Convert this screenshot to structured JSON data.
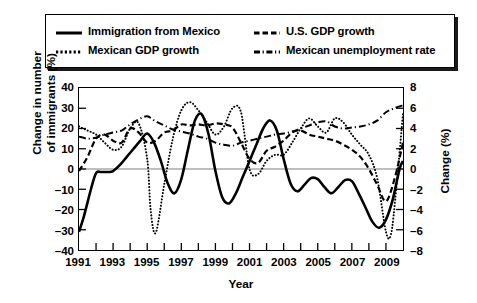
{
  "chart_data": {
    "type": "line",
    "title": "",
    "xlabel": "Year",
    "ylabel": "Change in number of immigrants (%)",
    "ylabel_line1": "Change in number",
    "ylabel_line2": "of immigrants (%)",
    "ylabel_right": "Change (%)",
    "xlim": [
      1991,
      2010
    ],
    "ylim": [
      -40,
      40
    ],
    "ylim_right": [
      -8,
      8
    ],
    "grid": false,
    "zero_line": true,
    "legend_position": "above-plot",
    "x_ticks": [
      1991,
      1993,
      1995,
      1997,
      1999,
      2001,
      2003,
      2005,
      2007,
      2009
    ],
    "x_tick_labels": [
      "1991",
      "1993",
      "1995",
      "1997",
      "1999",
      "2001",
      "2003",
      "2005",
      "2007",
      "2009"
    ],
    "x_minor_ticks": [
      1992,
      1994,
      1996,
      1998,
      2000,
      2002,
      2004,
      2006,
      2008,
      2010
    ],
    "y_ticks_left": [
      40,
      30,
      20,
      10,
      0,
      -10,
      -20,
      -30,
      -40
    ],
    "y_tick_labels_left": [
      "40",
      "30",
      "20",
      "10",
      "0",
      "–10",
      "–20",
      "–30",
      "–40"
    ],
    "y_ticks_right": [
      8,
      6,
      4,
      2,
      0,
      -2,
      -4,
      -6,
      -8
    ],
    "y_tick_labels_right": [
      "8",
      "6",
      "4",
      "2",
      "0",
      "–2",
      "–4",
      "–6",
      "–8"
    ],
    "colors": {
      "line": "#000000",
      "zero_line": "#808080",
      "frame": "#000000",
      "background": "#ffffff"
    },
    "series": [
      {
        "name": "Immigration from Mexico",
        "axis": "left",
        "style": "solid",
        "line_width": 2.6,
        "x": [
          1991.0,
          1991.3,
          1991.7,
          1992.0,
          1992.3,
          1992.7,
          1993.0,
          1993.4,
          1993.8,
          1994.2,
          1994.6,
          1995.0,
          1995.4,
          1995.8,
          1996.2,
          1996.6,
          1997.0,
          1997.4,
          1997.8,
          1998.2,
          1998.6,
          1999.0,
          1999.4,
          1999.8,
          2000.2,
          2000.6,
          2001.0,
          2001.4,
          2001.8,
          2002.2,
          2002.6,
          2003.0,
          2003.4,
          2003.8,
          2004.2,
          2004.6,
          2005.0,
          2005.4,
          2005.8,
          2006.2,
          2006.6,
          2007.0,
          2007.4,
          2007.8,
          2008.2,
          2008.6,
          2009.0,
          2009.4,
          2009.8,
          2010.0
        ],
        "y": [
          -31.0,
          -23.0,
          -10.0,
          -2.0,
          -1.5,
          -1.5,
          -1.0,
          2.0,
          6.0,
          10.0,
          14.0,
          17.5,
          13.0,
          4.0,
          -7.0,
          -12.0,
          -5.0,
          10.0,
          24.0,
          27.0,
          17.0,
          -1.0,
          -14.0,
          -17.0,
          -12.0,
          -4.0,
          4.0,
          12.0,
          20.0,
          24.0,
          19.0,
          5.0,
          -7.0,
          -11.0,
          -8.0,
          -4.5,
          -5.0,
          -9.0,
          -12.0,
          -9.0,
          -5.5,
          -6.0,
          -12.0,
          -19.0,
          -26.0,
          -29.0,
          -25.0,
          -15.0,
          0.0,
          4.0
        ]
      },
      {
        "name": "Mexican GDP growth",
        "axis": "right",
        "style": "dotted",
        "line_width": 2.0,
        "x": [
          1991.0,
          1991.5,
          1992.0,
          1992.5,
          1993.0,
          1993.5,
          1994.0,
          1994.5,
          1995.0,
          1995.2,
          1995.5,
          1996.0,
          1996.5,
          1997.0,
          1997.5,
          1998.0,
          1998.5,
          1999.0,
          1999.5,
          2000.0,
          2000.5,
          2001.0,
          2001.5,
          2002.0,
          2002.5,
          2003.0,
          2003.5,
          2004.0,
          2004.5,
          2005.0,
          2005.5,
          2006.0,
          2006.5,
          2007.0,
          2007.5,
          2008.0,
          2008.5,
          2009.0,
          2009.3,
          2009.6,
          2010.0
        ],
        "y": [
          4.2,
          3.8,
          3.4,
          2.6,
          1.9,
          2.2,
          4.0,
          4.5,
          1.0,
          -4.0,
          -6.3,
          -1.5,
          3.0,
          5.8,
          6.6,
          5.8,
          4.6,
          3.4,
          4.2,
          6.0,
          5.6,
          0.0,
          -0.5,
          0.8,
          1.4,
          1.4,
          2.6,
          4.0,
          5.0,
          4.2,
          3.6,
          5.0,
          4.6,
          3.4,
          2.4,
          1.4,
          -1.0,
          -6.2,
          -6.4,
          -2.0,
          5.5
        ]
      },
      {
        "name": "U.S. GDP growth",
        "axis": "right",
        "style": "dashed",
        "line_width": 2.2,
        "x": [
          1991.0,
          1991.5,
          1992.0,
          1992.5,
          1993.0,
          1993.5,
          1994.0,
          1994.5,
          1995.0,
          1995.5,
          1996.0,
          1996.5,
          1997.0,
          1997.5,
          1998.0,
          1998.5,
          1999.0,
          1999.5,
          2000.0,
          2000.5,
          2001.0,
          2001.5,
          2002.0,
          2002.5,
          2003.0,
          2003.5,
          2004.0,
          2004.5,
          2005.0,
          2005.5,
          2006.0,
          2006.5,
          2007.0,
          2007.5,
          2008.0,
          2008.5,
          2009.0,
          2009.5,
          2010.0
        ],
        "y": [
          -0.2,
          1.2,
          3.0,
          3.4,
          2.8,
          2.6,
          4.0,
          3.6,
          2.6,
          2.8,
          3.6,
          3.8,
          4.4,
          4.3,
          4.4,
          4.3,
          4.5,
          4.4,
          4.1,
          2.6,
          1.0,
          0.6,
          1.8,
          2.2,
          2.8,
          3.6,
          3.8,
          3.4,
          3.2,
          3.0,
          2.8,
          2.4,
          1.9,
          1.2,
          0.0,
          -1.6,
          -3.2,
          -1.0,
          2.6
        ]
      },
      {
        "name": "Mexican unemployment rate",
        "axis": "right",
        "style": "dashdot",
        "line_width": 2.0,
        "x": [
          1991.0,
          1991.5,
          1992.0,
          1992.5,
          1993.0,
          1993.5,
          1994.0,
          1994.5,
          1995.0,
          1995.5,
          1996.0,
          1996.5,
          1997.0,
          1997.5,
          1998.0,
          1998.5,
          1999.0,
          1999.5,
          2000.0,
          2000.5,
          2001.0,
          2001.5,
          2002.0,
          2002.5,
          2003.0,
          2003.5,
          2004.0,
          2004.5,
          2005.0,
          2005.5,
          2006.0,
          2006.5,
          2007.0,
          2007.5,
          2008.0,
          2008.5,
          2009.0,
          2009.5,
          2010.0
        ],
        "y": [
          3.2,
          3.0,
          3.1,
          3.4,
          3.6,
          3.8,
          4.4,
          4.9,
          5.2,
          4.7,
          4.3,
          3.9,
          3.7,
          3.5,
          3.2,
          3.0,
          2.6,
          2.4,
          2.3,
          2.6,
          2.8,
          3.0,
          3.2,
          3.4,
          3.5,
          3.7,
          4.0,
          4.3,
          4.6,
          4.7,
          4.2,
          4.0,
          4.1,
          4.2,
          4.4,
          4.8,
          5.6,
          6.0,
          6.3
        ]
      }
    ]
  },
  "legend": {
    "entries": [
      {
        "label": "Immigration from Mexico",
        "style": "solid"
      },
      {
        "label": "Mexican GDP growth",
        "style": "dotted"
      },
      {
        "label": "U.S. GDP growth",
        "style": "dashed"
      },
      {
        "label": "Mexican unemployment rate",
        "style": "dashdot"
      }
    ]
  }
}
